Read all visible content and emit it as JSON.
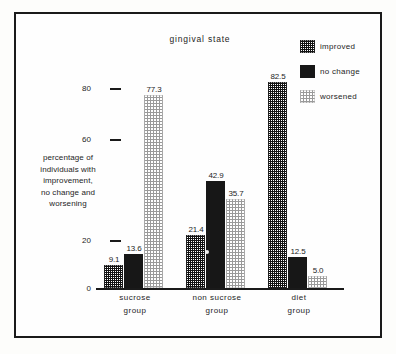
{
  "figure": {
    "title": "gingival state",
    "border_color": "#1a1a1a",
    "background": "#fefefe"
  },
  "legend": {
    "position": "top-right",
    "entries": [
      {
        "label": "improved",
        "pattern": "checkerboard-dark",
        "color": "#121212"
      },
      {
        "label": "no change",
        "pattern": "solid-black",
        "color": "#171717"
      },
      {
        "label": "worsened",
        "pattern": "dotted-light",
        "color": "#9a9a9a"
      }
    ]
  },
  "yaxis": {
    "label_lines": [
      "percentage of",
      "individuals with",
      "improvement,",
      "no change and",
      "worsening"
    ],
    "ticks": [
      {
        "value": "0",
        "pos": 0
      },
      {
        "value": "20",
        "pos": 20
      },
      {
        "value": "60",
        "pos": 60
      },
      {
        "value": "80",
        "pos": 80
      }
    ],
    "min": 0,
    "max": 90
  },
  "xaxis": {
    "categories": [
      {
        "line1": "sucrose",
        "line2": "group"
      },
      {
        "line1": "non sucrose",
        "line2": "group"
      },
      {
        "line1": "diet",
        "line2": "group"
      }
    ]
  },
  "chart_data": {
    "type": "bar",
    "title": "gingival state",
    "xlabel": "",
    "ylabel": "percentage of individuals with improvement, no change and worsening",
    "ylim": [
      0,
      90
    ],
    "yticks": [
      0,
      20,
      60,
      80
    ],
    "grid": false,
    "legend_position": "top-right",
    "categories": [
      "sucrose group",
      "non sucrose group",
      "diet group"
    ],
    "series": [
      {
        "name": "improved",
        "values": [
          9.1,
          21.4,
          82.5
        ],
        "labels": [
          "9.1",
          "21.4",
          "82.5"
        ]
      },
      {
        "name": "no change",
        "values": [
          13.6,
          42.9,
          12.5
        ],
        "labels": [
          "13.6",
          "42.9",
          "12.5"
        ]
      },
      {
        "name": "worsened",
        "values": [
          77.3,
          35.7,
          5.0
        ],
        "labels": [
          "77.3",
          "35.7",
          "5.0"
        ]
      }
    ]
  }
}
